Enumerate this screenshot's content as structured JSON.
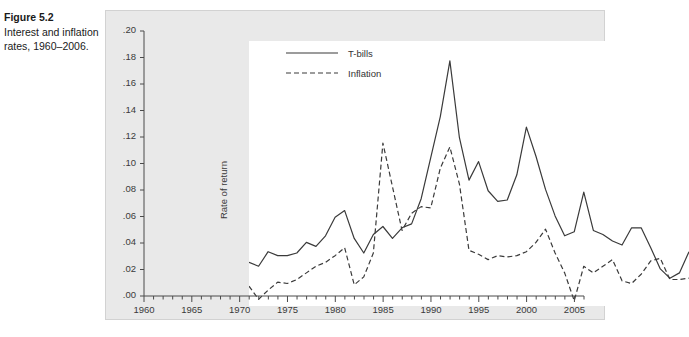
{
  "caption": {
    "figure_number": "Figure 5.2",
    "description": "Interest and inflation rates, 1960–2006."
  },
  "chart_data": {
    "type": "line",
    "title": "",
    "xlabel": "",
    "ylabel": "Rate of return",
    "xlim": [
      1960,
      2006
    ],
    "ylim": [
      0.0,
      0.2
    ],
    "grid": false,
    "legend_position": "top-left-inside",
    "y_ticks": [
      0.0,
      0.02,
      0.04,
      0.06,
      0.08,
      0.1,
      0.12,
      0.14,
      0.16,
      0.18,
      0.2
    ],
    "y_tick_labels": [
      ".00",
      ".02",
      ".04",
      ".06",
      ".08",
      ".10",
      ".12",
      ".14",
      ".16",
      ".18",
      ".20"
    ],
    "x_ticks": [
      1960,
      1965,
      1970,
      1975,
      1980,
      1985,
      1990,
      1995,
      2000,
      2005
    ],
    "x_tick_labels": [
      "1960",
      "1965",
      "1970",
      "1975",
      "1980",
      "1985",
      "1990",
      "1995",
      "2000",
      "2005"
    ],
    "x_minor_tick_step": 1,
    "x": [
      1960,
      1961,
      1962,
      1963,
      1964,
      1965,
      1966,
      1967,
      1968,
      1969,
      1970,
      1971,
      1972,
      1973,
      1974,
      1975,
      1976,
      1977,
      1978,
      1979,
      1980,
      1981,
      1982,
      1983,
      1984,
      1985,
      1986,
      1987,
      1988,
      1989,
      1990,
      1991,
      1992,
      1993,
      1994,
      1995,
      1996,
      1997,
      1998,
      1999,
      2000,
      2001,
      2002,
      2003,
      2004,
      2005,
      2006
    ],
    "series": [
      {
        "name": "T-bills",
        "style": "solid",
        "color": "#3a3a3a",
        "values": [
          0.033,
          0.03,
          0.041,
          0.038,
          0.038,
          0.04,
          0.048,
          0.045,
          0.053,
          0.067,
          0.072,
          0.051,
          0.04,
          0.054,
          0.06,
          0.051,
          0.059,
          0.062,
          0.081,
          0.112,
          0.143,
          0.185,
          0.127,
          0.095,
          0.109,
          0.087,
          0.079,
          0.08,
          0.099,
          0.135,
          0.113,
          0.088,
          0.068,
          0.053,
          0.056,
          0.086,
          0.057,
          0.054,
          0.049,
          0.046,
          0.059,
          0.059,
          0.044,
          0.028,
          0.021,
          0.025,
          0.041
        ]
      },
      {
        "name": "Inflation",
        "style": "dashed",
        "color": "#3a3a3a",
        "values": [
          0.015,
          0.005,
          0.012,
          0.018,
          0.017,
          0.02,
          0.025,
          0.03,
          0.033,
          0.038,
          0.044,
          0.016,
          0.022,
          0.04,
          0.123,
          0.09,
          0.057,
          0.07,
          0.075,
          0.074,
          0.104,
          0.12,
          0.092,
          0.042,
          0.039,
          0.035,
          0.038,
          0.037,
          0.038,
          0.041,
          0.048,
          0.058,
          0.04,
          0.025,
          0.004,
          0.03,
          0.025,
          0.03,
          0.035,
          0.019,
          0.017,
          0.024,
          0.034,
          0.036,
          0.02,
          0.02,
          0.021
        ]
      }
    ],
    "legend": [
      "T-bills",
      "Inflation"
    ]
  }
}
